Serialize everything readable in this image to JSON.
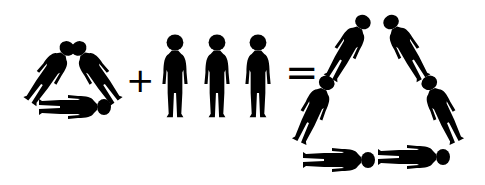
{
  "diagram": {
    "colors": {
      "figure": "#000000",
      "background": "#ffffff"
    },
    "operators": {
      "plus": "+",
      "equals": "="
    },
    "groups": [
      {
        "name": "triangle-of-three",
        "count": 3
      },
      {
        "name": "three-standing",
        "count": 3
      },
      {
        "name": "triangle-of-six",
        "count": 6
      }
    ]
  }
}
